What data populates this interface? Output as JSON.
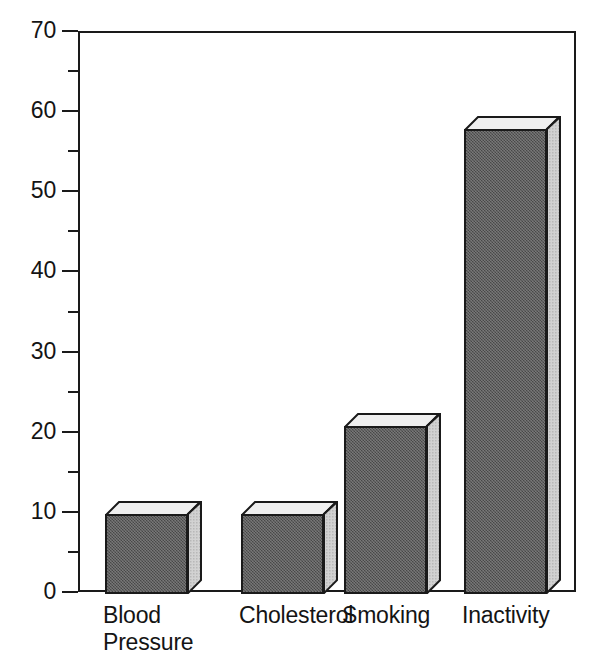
{
  "chart_data": {
    "type": "bar",
    "title": "",
    "subtitle": "",
    "xlabel": "",
    "ylabel": "",
    "categories": [
      "Blood\nPressure",
      "Cholesterol",
      "Smoking",
      "Inactivity"
    ],
    "category_labels_flat": [
      "Blood Pressure",
      "Cholesterol",
      "Smoking",
      "Inactivity"
    ],
    "values": [
      10,
      10,
      21,
      58
    ],
    "ylim": [
      0,
      70
    ],
    "y_major_ticks": [
      0,
      10,
      20,
      30,
      40,
      50,
      60,
      70
    ],
    "y_tick_labels": [
      "0",
      "10",
      "20",
      "30",
      "40",
      "50",
      "60",
      "70"
    ],
    "y_minor_ticks": [
      5,
      15,
      25,
      35,
      45,
      55,
      65
    ],
    "grid": false,
    "legend": null,
    "style": "3d-blocks",
    "colors": {
      "bar_front": "#5a5a5a",
      "bar_side": "#c9c9c9",
      "bar_top": "#efefef",
      "outline": "#1a1a1a",
      "background": "#ffffff",
      "text": "#141414"
    }
  }
}
